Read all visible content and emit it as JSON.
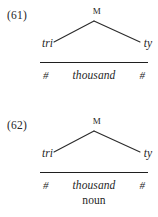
{
  "page": {
    "background_color": "#ffffff",
    "text_color": "#1f1f1f",
    "rule_color": "#1f1f1f",
    "branch_color": "#2b2b2b"
  },
  "examples": [
    {
      "number": "(61)",
      "tree": {
        "root_label": "M",
        "left_leaf": "tri",
        "right_leaf": "ty"
      },
      "tier": {
        "left_boundary": "#",
        "stem": "thousand",
        "right_boundary": "#"
      },
      "gloss": ""
    },
    {
      "number": "(62)",
      "tree": {
        "root_label": "M",
        "left_leaf": "tri",
        "right_leaf": "ty"
      },
      "tier": {
        "left_boundary": "#",
        "stem": "thousand",
        "right_boundary": "#"
      },
      "gloss": "noun"
    }
  ]
}
